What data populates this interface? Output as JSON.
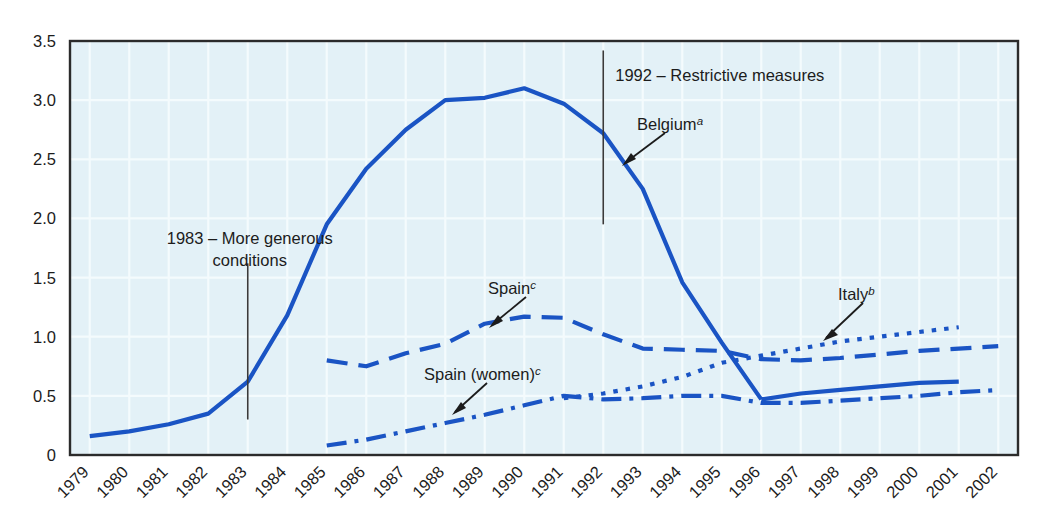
{
  "chart_data": {
    "type": "line",
    "title": "",
    "subtitle": "",
    "xlabel": "",
    "ylabel": "",
    "xlim": [
      1979,
      2002
    ],
    "ylim": [
      0,
      3.5
    ],
    "grid": true,
    "legend_position": "inline-annotations",
    "x": [
      1979,
      1980,
      1981,
      1982,
      1983,
      1984,
      1985,
      1986,
      1987,
      1988,
      1989,
      1990,
      1991,
      1992,
      1993,
      1994,
      1995,
      1996,
      1997,
      1998,
      1999,
      2000,
      2001,
      2002
    ],
    "ytick_labels": [
      "0",
      "0.5",
      "1.0",
      "1.5",
      "2.0",
      "2.5",
      "3.0",
      "3.5"
    ],
    "ytick_values": [
      0,
      0.5,
      1.0,
      1.5,
      2.0,
      2.5,
      3.0,
      3.5
    ],
    "xtick_labels": [
      "1979",
      "1980",
      "1981",
      "1982",
      "1983",
      "1984",
      "1985",
      "1986",
      "1987",
      "1988",
      "1989",
      "1990",
      "1991",
      "1992",
      "1993",
      "1994",
      "1995",
      "1996",
      "1997",
      "1998",
      "1999",
      "2000",
      "2001",
      "2002"
    ],
    "series": [
      {
        "name": "Belgium",
        "footnote": "a",
        "style": "solid",
        "color": "#1a54c4",
        "x": [
          1979,
          1980,
          1981,
          1982,
          1983,
          1984,
          1985,
          1986,
          1987,
          1988,
          1989,
          1990,
          1991,
          1992,
          1993,
          1994,
          1995,
          1996
        ],
        "values": [
          0.16,
          0.2,
          0.26,
          0.35,
          0.62,
          1.18,
          1.95,
          2.42,
          2.75,
          3.0,
          3.02,
          3.1,
          2.97,
          2.72,
          2.25,
          1.46,
          0.95,
          0.47
        ]
      },
      {
        "name": "Belgium",
        "footnote": "a",
        "style": "solid",
        "color": "#1a54c4",
        "segment": "post-1996",
        "x": [
          1996,
          1997,
          1998,
          1999,
          2000,
          2001
        ],
        "values": [
          0.47,
          0.52,
          0.55,
          0.58,
          0.61,
          0.62
        ]
      },
      {
        "name": "Spain",
        "footnote": "c",
        "style": "dashed",
        "color": "#1a54c4",
        "x": [
          1985,
          1986,
          1987,
          1988,
          1989,
          1990,
          1991,
          1992,
          1993,
          1994,
          1995,
          1996,
          1997,
          1998,
          1999,
          2000,
          2001,
          2002
        ],
        "values": [
          0.8,
          0.75,
          0.86,
          0.94,
          1.11,
          1.17,
          1.16,
          1.02,
          0.9,
          0.89,
          0.88,
          0.81,
          0.8,
          0.82,
          0.85,
          0.88,
          0.9,
          0.92
        ]
      },
      {
        "name": "Italy",
        "footnote": "b",
        "style": "dotted",
        "color": "#1a54c4",
        "x": [
          1991,
          1992,
          1993,
          1994,
          1995,
          1996,
          1997,
          1998,
          1999,
          2000,
          2001
        ],
        "values": [
          0.48,
          0.52,
          0.58,
          0.66,
          0.78,
          0.84,
          0.9,
          0.96,
          1.0,
          1.04,
          1.08
        ]
      },
      {
        "name": "Spain (women)",
        "footnote": "c",
        "style": "dash-dot",
        "color": "#1a54c4",
        "x": [
          1985,
          1986,
          1987,
          1988,
          1989,
          1990,
          1991,
          1992,
          1993,
          1994,
          1995,
          1996,
          1997,
          1998,
          1999,
          2000,
          2001,
          2002
        ],
        "values": [
          0.08,
          0.13,
          0.2,
          0.27,
          0.34,
          0.42,
          0.5,
          0.47,
          0.48,
          0.5,
          0.5,
          0.44,
          0.44,
          0.46,
          0.48,
          0.5,
          0.53,
          0.55
        ]
      }
    ],
    "annotations": [
      {
        "id": "annot-1983",
        "lines": [
          "1983 – More generous",
          "conditions"
        ],
        "marker_year": 1983,
        "marker_y_top": 1.62,
        "marker_y_bottom": 0.3
      },
      {
        "id": "annot-1992",
        "lines": [
          "1992 – Restrictive measures"
        ],
        "marker_year": 1992,
        "marker_y_top": 3.42,
        "marker_y_bottom": 1.95
      }
    ],
    "series_labels": [
      {
        "id": "label-belgium",
        "text": "Belgium",
        "footnote": "a"
      },
      {
        "id": "label-spain",
        "text": "Spain",
        "footnote": "c"
      },
      {
        "id": "label-italy",
        "text": "Italy",
        "footnote": "b"
      },
      {
        "id": "label-spain-women",
        "text": "Spain (women)",
        "footnote": "c"
      }
    ],
    "colors": {
      "series": "#1a54c4",
      "plot_background": "#e3f1f7",
      "grid": "#f4fbfd",
      "axis": "#2b2b2b",
      "text": "#1c1c1c"
    }
  }
}
